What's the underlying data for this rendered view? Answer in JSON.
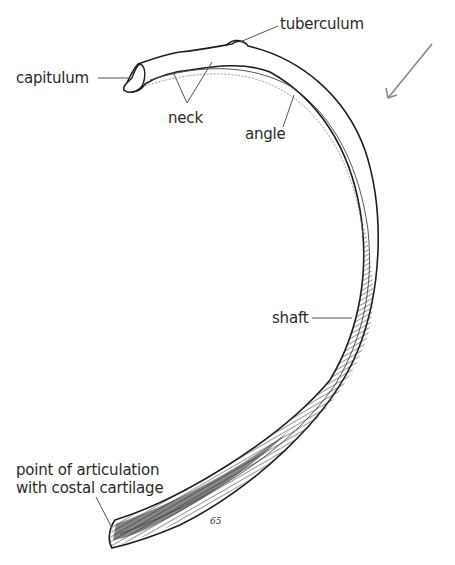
{
  "figure": {
    "labels": {
      "tuberculum": "tuberculum",
      "capitulum": "capitulum",
      "neck": "neck",
      "angle": "angle",
      "shaft": "shaft",
      "articulation_line1": "point of articulation",
      "articulation_line2": "with costal cartilage"
    },
    "signature": "65",
    "orientation_mark": "arrow-down-left",
    "colors": {
      "ink": "#1e1e1e",
      "label_text": "#2a2a2a",
      "leader_line": "#555555",
      "background": "#ffffff"
    }
  }
}
